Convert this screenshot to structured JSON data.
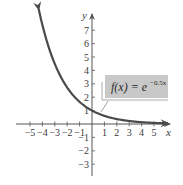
{
  "chart_data": {
    "type": "line",
    "title": "",
    "xlabel": "x",
    "ylabel": "y",
    "xlim": [
      -5.8,
      6.3
    ],
    "ylim": [
      -4.4,
      8.0
    ],
    "x_ticks": [
      -5,
      -4,
      -3,
      -2,
      -1,
      1,
      2,
      3,
      4,
      5
    ],
    "y_ticks": [
      -3,
      -2,
      -1,
      1,
      2,
      3,
      4,
      5,
      6,
      7
    ],
    "grid": false,
    "series": [
      {
        "name": "f(x) = e^{-0.5x}",
        "function": "exp(-0.5*x)",
        "x": [
          -4,
          -3,
          -2,
          -1,
          0,
          1,
          2,
          3,
          4,
          5,
          6
        ],
        "values": [
          7.39,
          4.48,
          2.72,
          1.65,
          1.0,
          0.61,
          0.37,
          0.22,
          0.14,
          0.08,
          0.05
        ],
        "color": "#4a4a4a",
        "arrows": "both"
      }
    ],
    "annotations": [
      {
        "text_main": "f(x) = e",
        "exponent": "−0.5x",
        "box_color": "#c8c8c8",
        "points_to_x": 0.7
      }
    ]
  },
  "labels": {
    "x_axis": "x",
    "y_axis": "y",
    "fn_main": "f(x) = e",
    "fn_exp": "−0.5x"
  },
  "colors": {
    "axis": "#555555",
    "curve": "#4a4a4a",
    "box": "#c8c8c8",
    "text": "#3a3a3a"
  }
}
